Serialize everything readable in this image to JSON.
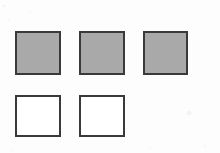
{
  "figure": {
    "title": "",
    "background_color": "#fdfdfd",
    "width": 220,
    "height": 153,
    "ink_color": "#3a3a3a",
    "fill_gray": "#a9a9a9",
    "fill_white": "#ffffff",
    "rows": [
      {
        "name": "top-row",
        "fill_state": "shaded",
        "count": 3
      },
      {
        "name": "bottom-row",
        "fill_state": "unshaded",
        "count": 2
      }
    ]
  },
  "shapes": [
    {
      "id": "square-1",
      "row": "top",
      "index": 1,
      "fill": "#a9a9a9",
      "border_color": "#3a3a3a",
      "border_width": 2,
      "x": 15,
      "y": 31,
      "width": 46,
      "height": 44,
      "state": "shaded"
    },
    {
      "id": "square-2",
      "row": "top",
      "index": 2,
      "fill": "#a9a9a9",
      "border_color": "#3a3a3a",
      "border_width": 2,
      "x": 79,
      "y": 31,
      "width": 46,
      "height": 44,
      "state": "shaded"
    },
    {
      "id": "square-3",
      "row": "top",
      "index": 3,
      "fill": "#a9a9a9",
      "border_color": "#3a3a3a",
      "border_width": 2,
      "x": 143,
      "y": 31,
      "width": 45,
      "height": 44,
      "state": "shaded"
    },
    {
      "id": "square-4",
      "row": "bottom",
      "index": 1,
      "fill": "#ffffff",
      "border_color": "#3a3a3a",
      "border_width": 2,
      "x": 15,
      "y": 95,
      "width": 46,
      "height": 42,
      "state": "unshaded"
    },
    {
      "id": "square-5",
      "row": "bottom",
      "index": 2,
      "fill": "#ffffff",
      "border_color": "#3a3a3a",
      "border_width": 2,
      "x": 79,
      "y": 95,
      "width": 46,
      "height": 42,
      "state": "unshaded"
    }
  ]
}
